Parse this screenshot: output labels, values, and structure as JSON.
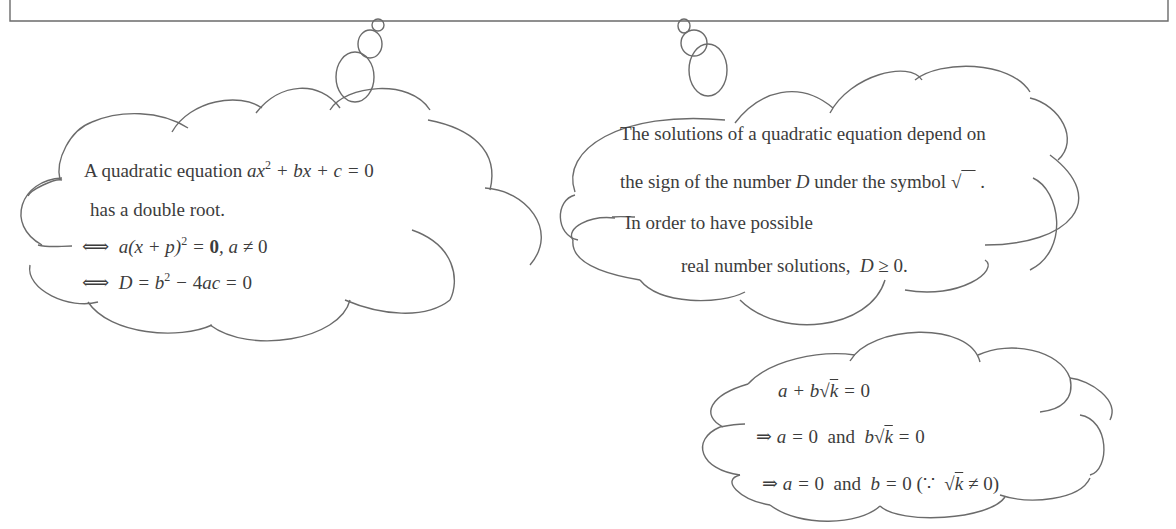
{
  "top_box": {
    "description": "partially visible rectangular text box at top (content cropped)"
  },
  "cloud_left": {
    "line1_text": "A quadratic equation ",
    "line1_math": "ax² + bx + c = 0",
    "line2": "has a double root.",
    "line3_symbol": "⟺",
    "line3_math": "a(x + p)² = 0, a ≠ 0",
    "line4_symbol": "⟺",
    "line4_math": "D = b² − 4ac = 0"
  },
  "cloud_right": {
    "line1": "The solutions of a quadratic equation depend on",
    "line2_prefix": "the sign of the number ",
    "line2_var": "D",
    "line2_suffix": " under the symbol √‾‾ .",
    "line3": "In order to have possible",
    "line4_prefix": "real number solutions, ",
    "line4_math": "D ≥ 0."
  },
  "cloud_bottom": {
    "line1": "a + b√k = 0",
    "line2": "⇒ a = 0  and  b√k = 0",
    "line3": "⇒ a = 0  and  b = 0 (∵  √k ≠ 0)"
  }
}
